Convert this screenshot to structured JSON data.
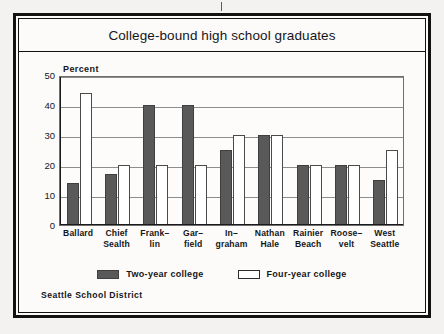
{
  "figure": {
    "title": "College-bound high school graduates",
    "footer": "Seattle School District"
  },
  "legend": {
    "items": [
      {
        "label": "Two-year college",
        "color": "#595959",
        "style": "filled"
      },
      {
        "label": "Four-year college",
        "color": "#ffffff",
        "style": "outline"
      }
    ]
  },
  "chart_data": {
    "type": "bar",
    "title": "College-bound high school graduates",
    "xlabel": "",
    "ylabel": "Percent",
    "ylim": [
      0,
      50
    ],
    "yticks": [
      0,
      10,
      20,
      30,
      40,
      50
    ],
    "grid": true,
    "legend_position": "bottom-center",
    "categories": [
      "Ballard",
      "Chief Sealth",
      "Franklin",
      "Garfield",
      "Ingraham",
      "Nathan Hale",
      "Rainier Beach",
      "Roosevelt",
      "West Seattle"
    ],
    "category_lines": [
      [
        "Ballard",
        ""
      ],
      [
        "Chief",
        "Sealth"
      ],
      [
        "Frank–",
        "lin"
      ],
      [
        "Gar–",
        "field"
      ],
      [
        "In–",
        "graham"
      ],
      [
        "Nathan",
        "Hale"
      ],
      [
        "Rainier",
        "Beach"
      ],
      [
        "Roose–",
        "velt"
      ],
      [
        "West",
        "Seattle"
      ]
    ],
    "series": [
      {
        "name": "Two-year college",
        "color": "#595959",
        "values": [
          14,
          17,
          40,
          40,
          25,
          30,
          20,
          20,
          15
        ]
      },
      {
        "name": "Four-year college",
        "color": "#ffffff",
        "values": [
          44,
          20,
          20,
          20,
          30,
          30,
          20,
          20,
          25
        ]
      }
    ]
  }
}
